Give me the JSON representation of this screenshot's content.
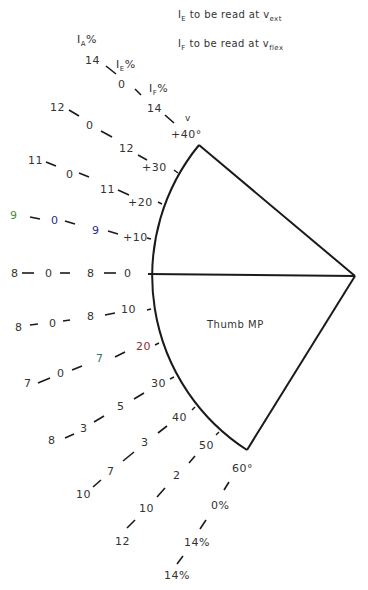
{
  "notes": {
    "line1": {
      "main": "I",
      "sub": "E",
      "text": " to be read at v",
      "sub2": "ext"
    },
    "line2": {
      "main": "I",
      "sub": "F",
      "text": " to be read at v",
      "sub2": "flex"
    }
  },
  "headers": {
    "ia": {
      "main": "I",
      "sub": "A",
      "pct": "%"
    },
    "ie": {
      "main": "I",
      "sub": "E",
      "pct": "%"
    },
    "if": {
      "main": "I",
      "sub": "F",
      "pct": "%"
    },
    "v": "v"
  },
  "joint_label": "Thumb MP",
  "colors": {
    "line": "#1a1a1a",
    "text": "#333333",
    "green": "#4a8a3a",
    "blue": "#2a2a80",
    "teal": "#2a7a7a",
    "red": "#8a3030"
  },
  "rows": [
    {
      "angle": "+40°",
      "ia": "14",
      "ie": "0",
      "if": "14"
    },
    {
      "angle": "+30",
      "ia": "12",
      "ie": "0",
      "if": "12"
    },
    {
      "angle": "+20",
      "ia": "11",
      "ie": "0",
      "if": "11"
    },
    {
      "angle": "+10",
      "ia": "9",
      "ie": "0",
      "if": "9"
    },
    {
      "angle": "0",
      "ia": "8",
      "ie": "0",
      "if": "8"
    },
    {
      "angle": "10",
      "ia": "8",
      "ie": "0",
      "if": "8"
    },
    {
      "angle": "20",
      "ia": "7",
      "ie": "0",
      "if": "7"
    },
    {
      "angle": "30",
      "ia": "8",
      "ie": "3",
      "if": "5"
    },
    {
      "angle": "40",
      "ia": "10",
      "ie": "7",
      "if": "3"
    },
    {
      "angle": "50",
      "ia": "12",
      "ie": "10",
      "if": "2"
    },
    {
      "angle": "60°",
      "ia": "14%",
      "ie": "14%",
      "if": "0%"
    }
  ]
}
